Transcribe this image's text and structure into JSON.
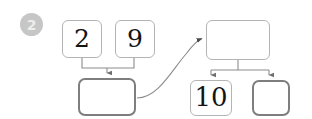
{
  "page": {
    "background_color": "#ffffff",
    "width": 312,
    "height": 119
  },
  "badge": {
    "label": "2",
    "fill_color": "#c6c6c6",
    "text_color": "#ededed",
    "name": "step-number-badge"
  },
  "diagram": {
    "line_color": "#8c8c8c",
    "thin_border_color": "#b4b4b4",
    "thick_border_color": "#7e7e7e",
    "nodes": [
      {
        "id": "addend-left",
        "label": "2",
        "empty": false,
        "style": "thin",
        "x": 62,
        "y": 20,
        "w": 40,
        "h": 38
      },
      {
        "id": "addend-right",
        "label": "9",
        "empty": false,
        "style": "thin",
        "x": 115,
        "y": 20,
        "w": 40,
        "h": 38
      },
      {
        "id": "sum-blank-left",
        "label": "",
        "empty": true,
        "style": "thick",
        "x": 78,
        "y": 78,
        "w": 58,
        "h": 38
      },
      {
        "id": "total-blank-top-right",
        "label": "",
        "empty": true,
        "style": "thin",
        "x": 206,
        "y": 20,
        "w": 64,
        "h": 40
      },
      {
        "id": "part-ten",
        "label": "10",
        "empty": false,
        "style": "thin",
        "x": 190,
        "y": 80,
        "w": 42,
        "h": 36
      },
      {
        "id": "part-blank-right",
        "label": "",
        "empty": true,
        "style": "thick",
        "x": 252,
        "y": 80,
        "w": 38,
        "h": 36
      }
    ],
    "connectors": [
      {
        "id": "bracket-addends-to-sum",
        "kind": "bracket-down",
        "from": [
          "addend-left",
          "addend-right"
        ],
        "to": "sum-blank-left",
        "arrow": true
      },
      {
        "id": "curve-sum-to-total",
        "kind": "curved-arrow",
        "from": "sum-blank-left",
        "to": "total-blank-top-right",
        "arrow": true
      },
      {
        "id": "bracket-total-to-parts",
        "kind": "bracket-split",
        "from": "total-blank-top-right",
        "to": [
          "part-ten",
          "part-blank-right"
        ],
        "arrow": true
      }
    ]
  }
}
